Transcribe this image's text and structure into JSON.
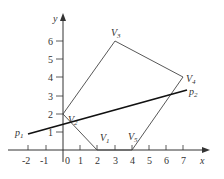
{
  "diagram": {
    "type": "feasible-region-plot",
    "axes": {
      "x_label": "x",
      "y_label": "y",
      "x_ticks": [
        "-2",
        "-1",
        "0",
        "1",
        "2",
        "3",
        "4",
        "5",
        "6",
        "7"
      ],
      "y_ticks": [
        "1",
        "2",
        "3",
        "4",
        "5",
        "6"
      ]
    },
    "vertices": [
      {
        "name": "V",
        "sub": "1",
        "x": 2,
        "y": 0
      },
      {
        "name": "V",
        "sub": "2",
        "x": 0,
        "y": 2
      },
      {
        "name": "V",
        "sub": "3",
        "x": 3,
        "y": 6
      },
      {
        "name": "V",
        "sub": "4",
        "x": 7,
        "y": 4
      },
      {
        "name": "V",
        "sub": "5",
        "x": 4,
        "y": 0
      }
    ],
    "line": {
      "start": {
        "name": "p",
        "sub": "1",
        "x": -2,
        "y": 0.9
      },
      "end": {
        "name": "p",
        "sub": "2",
        "x": 7.2,
        "y": 3.3
      }
    },
    "colors": {
      "axis": "#333333",
      "polygon": "#444444",
      "line": "#111111"
    }
  }
}
